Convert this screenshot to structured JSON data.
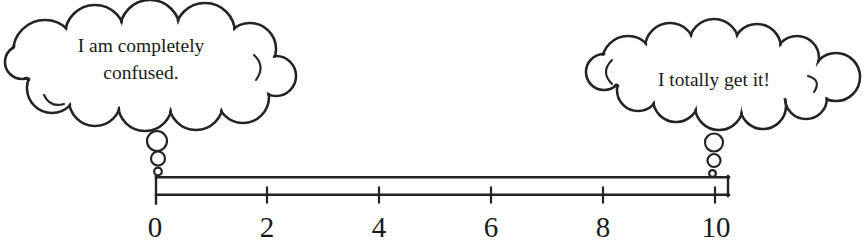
{
  "figure": {
    "background_color": "#ffffff",
    "ink_color": "#242424"
  },
  "bubbles": {
    "left": {
      "lines": [
        "I am completely",
        "confused."
      ]
    },
    "right": {
      "lines": [
        "I totally get it!"
      ]
    }
  },
  "scale": {
    "tick_labels": [
      "0",
      "2",
      "4",
      "6",
      "8",
      "10"
    ]
  }
}
